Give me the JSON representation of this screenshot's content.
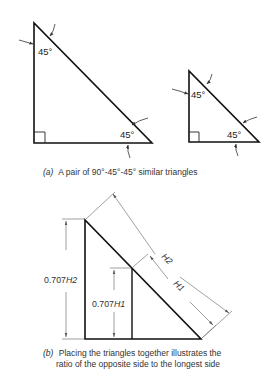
{
  "figure": {
    "part_a": {
      "label": "(a)",
      "caption": "A pair of 90°-45°-45° similar triangles",
      "large_triangle": {
        "top_angle": "45°",
        "bottom_angle": "45°",
        "right_angle_marker": true
      },
      "small_triangle": {
        "top_angle": "45°",
        "bottom_angle": "45°",
        "right_angle_marker": true
      }
    },
    "part_b": {
      "label": "(b)",
      "caption_line1": "Placing the triangles together illustrates the",
      "caption_line2": "ratio of the opposite side to the longest side",
      "dimensions": {
        "outer_height": "0.707H2",
        "inner_height": "0.707H1",
        "outer_hypotenuse": "H2",
        "inner_hypotenuse": "H1"
      },
      "dim_parts": {
        "outer_height_num": "0.707",
        "outer_height_var": "H2",
        "inner_height_num": "0.707",
        "inner_height_var": "H1"
      }
    }
  }
}
